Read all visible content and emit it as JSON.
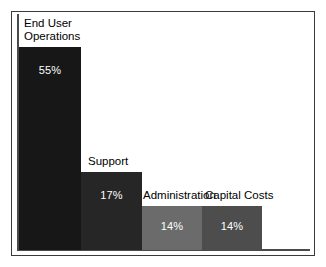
{
  "chart_data": {
    "type": "bar",
    "title": "",
    "subtitle": "",
    "xlabel": "",
    "ylabel": "",
    "grid": false,
    "legend": "none",
    "ylim": [
      0,
      60
    ],
    "categories": [
      "End User Operations",
      "Support",
      "Administration",
      "Capital Costs"
    ],
    "values": [
      55,
      17,
      14,
      14
    ],
    "value_labels": [
      "55%",
      "17%",
      "14%",
      "14%"
    ],
    "units": "percent",
    "bars": [
      {
        "category": "End User Operations",
        "label_line1": "End User",
        "label_line2": "Operations",
        "value": 55,
        "value_label": "55%",
        "color": "#171717",
        "value_text_color": "#ffffff"
      },
      {
        "category": "Support",
        "label_line1": "Support",
        "label_line2": "",
        "value": 17,
        "value_label": "17%",
        "color": "#262626",
        "value_text_color": "#ffffff"
      },
      {
        "category": "Administration",
        "label_line1": "Administration",
        "label_line2": "",
        "value": 14,
        "value_label": "14%",
        "color": "#6b6b6b",
        "value_text_color": "#ffffff"
      },
      {
        "category": "Capital Costs",
        "label_line1": "Capital Costs",
        "label_line2": "",
        "value": 14,
        "value_label": "14%",
        "color": "#4d4d4d",
        "value_text_color": "#ffffff"
      }
    ],
    "axis_color": "#4a4a4a",
    "frame_color": "#3a3a3a",
    "background_color": "#ffffff"
  }
}
